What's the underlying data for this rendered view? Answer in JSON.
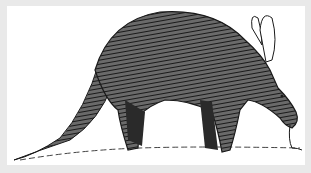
{
  "image": {
    "subject": "aardvark",
    "style": "black-and-white ink illustration",
    "alt": "Pen-and-ink drawing of an aardvark standing in profile facing right, with long tapered tail, arched hatched body, tall ears and tongue touching the ground",
    "colors": {
      "border": "#e9e9e9",
      "background": "#ffffff",
      "ink": "#1a1a1a",
      "midtone": "#555555"
    }
  }
}
